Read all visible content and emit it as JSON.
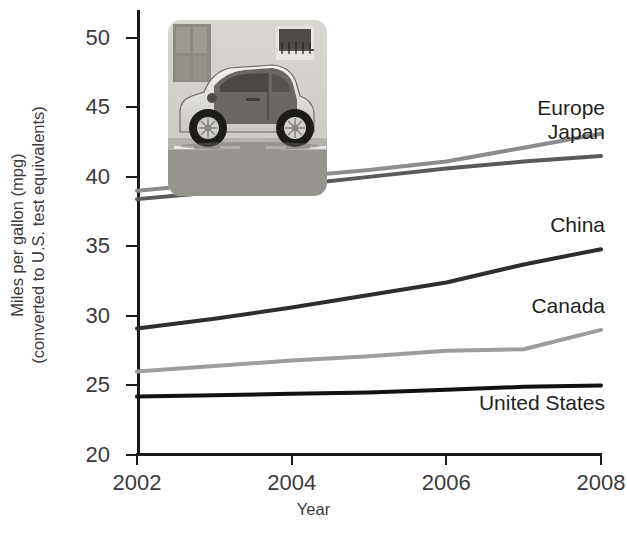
{
  "chart_data": {
    "type": "line",
    "title": "",
    "xlabel": "Year",
    "ylabel_line1": "Miles per gallon (mpg)",
    "ylabel_line2": "(converted to U.S. test equivalents)",
    "x": [
      2002,
      2003,
      2004,
      2005,
      2006,
      2007,
      2008
    ],
    "xlim": [
      2002,
      2008
    ],
    "ylim": [
      20,
      52
    ],
    "xticks": [
      "2002",
      "2004",
      "2006",
      "2008"
    ],
    "xtick_values": [
      2002,
      2004,
      2006,
      2008
    ],
    "yticks": [
      "20",
      "25",
      "30",
      "35",
      "40",
      "45",
      "50"
    ],
    "ytick_values": [
      20,
      25,
      30,
      35,
      40,
      45,
      50
    ],
    "grid": false,
    "legend_position": "right-inline-end-labels",
    "series": [
      {
        "name": "Europe",
        "color": "#8c8c8c",
        "values": [
          39.0,
          39.5,
          40.0,
          40.5,
          41.1,
          42.1,
          43.1
        ]
      },
      {
        "name": "Japan",
        "color": "#5a5a5a",
        "values": [
          38.4,
          38.9,
          39.4,
          40.0,
          40.6,
          41.1,
          41.5
        ]
      },
      {
        "name": "China",
        "color": "#2e2e2e",
        "values": [
          29.1,
          29.8,
          30.6,
          31.5,
          32.4,
          33.7,
          34.8
        ]
      },
      {
        "name": "Canada",
        "color": "#9d9d9d",
        "values": [
          26.0,
          26.4,
          26.8,
          27.1,
          27.5,
          27.6,
          29.0
        ]
      },
      {
        "name": "United States",
        "color": "#111111",
        "values": [
          24.2,
          24.3,
          24.4,
          24.5,
          24.7,
          24.9,
          25.0
        ]
      }
    ]
  },
  "photo": {
    "alt_name": "smart-car-photo",
    "caption": ""
  }
}
